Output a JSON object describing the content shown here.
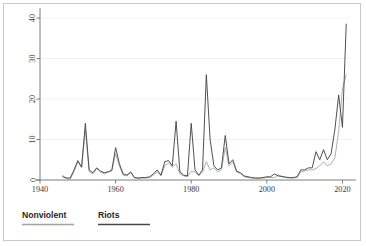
{
  "chart_data": {
    "type": "line",
    "title": "",
    "subtitle": "",
    "xlabel": "",
    "ylabel": "",
    "xlim": [
      1940,
      2022
    ],
    "ylim": [
      0,
      41
    ],
    "xticks": [
      1940,
      1960,
      1980,
      2000,
      2020
    ],
    "xtick_labels": [
      "1940",
      "1960",
      "1980",
      "2000",
      "2020"
    ],
    "yticks": [
      0,
      10,
      20,
      30,
      40
    ],
    "ytick_labels": [
      "0",
      "10",
      "20",
      "30",
      "40"
    ],
    "grid": "horizontal-faint",
    "legend_position": "below-axis-left",
    "x": [
      1946,
      1947,
      1948,
      1949,
      1950,
      1951,
      1952,
      1953,
      1954,
      1955,
      1956,
      1957,
      1958,
      1959,
      1960,
      1961,
      1962,
      1963,
      1964,
      1965,
      1966,
      1967,
      1968,
      1969,
      1970,
      1971,
      1972,
      1973,
      1974,
      1975,
      1976,
      1977,
      1978,
      1979,
      1980,
      1981,
      1982,
      1983,
      1984,
      1985,
      1986,
      1987,
      1988,
      1989,
      1990,
      1991,
      1992,
      1993,
      1994,
      1995,
      1996,
      1997,
      1998,
      1999,
      2000,
      2001,
      2002,
      2003,
      2004,
      2005,
      2006,
      2007,
      2008,
      2009,
      2010,
      2011,
      2012,
      2013,
      2014,
      2015,
      2016,
      2017,
      2018,
      2019,
      2020,
      2021
    ],
    "series": [
      {
        "name": "Nonviolent",
        "color": "#9aa89a",
        "values": [
          1.2,
          0.2,
          0.2,
          2.0,
          4.5,
          3.0,
          12.5,
          2.0,
          1.5,
          2.8,
          2.0,
          1.5,
          2.0,
          2.2,
          6.5,
          3.5,
          1.2,
          1.0,
          1.8,
          0.5,
          0.4,
          0.5,
          0.5,
          0.6,
          1.2,
          2.0,
          1.0,
          3.5,
          4.2,
          3.2,
          4.0,
          1.5,
          1.0,
          0.8,
          2.2,
          2.0,
          1.0,
          2.0,
          4.5,
          2.5,
          3.0,
          2.0,
          2.5,
          8.0,
          3.5,
          4.5,
          2.0,
          1.6,
          0.8,
          0.6,
          0.5,
          0.4,
          0.4,
          0.5,
          0.6,
          0.6,
          0.6,
          1.2,
          0.8,
          0.6,
          0.5,
          0.5,
          0.6,
          2.0,
          2.2,
          2.5,
          2.5,
          2.8,
          3.5,
          4.5,
          3.5,
          4.0,
          5.5,
          12.0,
          22.5,
          26.0
        ]
      },
      {
        "name": "Riots",
        "color": "#474747",
        "values": [
          0.8,
          0.5,
          0.5,
          2.5,
          4.8,
          3.2,
          14.0,
          2.5,
          1.8,
          3.0,
          2.2,
          1.8,
          2.0,
          2.5,
          8.0,
          4.0,
          1.5,
          1.2,
          2.0,
          0.6,
          0.5,
          0.6,
          0.6,
          0.8,
          1.5,
          2.5,
          1.2,
          4.5,
          4.8,
          3.5,
          14.5,
          2.0,
          1.2,
          1.0,
          14.0,
          2.5,
          1.2,
          2.5,
          26.0,
          10.0,
          3.5,
          2.5,
          3.0,
          11.0,
          4.0,
          5.0,
          2.2,
          1.8,
          1.0,
          0.8,
          0.6,
          0.5,
          0.5,
          0.6,
          0.8,
          0.8,
          1.5,
          1.0,
          0.9,
          0.7,
          0.6,
          0.6,
          0.8,
          2.5,
          2.5,
          3.0,
          3.0,
          7.0,
          5.0,
          7.5,
          5.0,
          6.5,
          12.5,
          21.0,
          13.0,
          38.5
        ]
      }
    ]
  },
  "legend": {
    "items": [
      {
        "label": "Nonviolent",
        "color": "#9aa89a"
      },
      {
        "label": "Riots",
        "color": "#474747"
      }
    ]
  },
  "axes": {
    "y_axis_name": "count-axis",
    "x_axis_name": "year-axis"
  }
}
